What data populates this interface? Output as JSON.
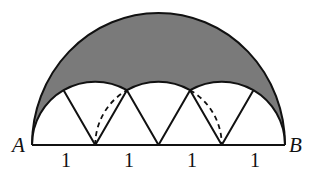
{
  "diagram": {
    "type": "geometry-figure",
    "points": {
      "A": {
        "label": "A"
      },
      "B": {
        "label": "B"
      }
    },
    "segment_labels": [
      "1",
      "1",
      "1",
      "1"
    ],
    "colors": {
      "shade": "#7a7a7a",
      "stroke": "#111111",
      "background": "#ffffff"
    },
    "elements": [
      {
        "name": "large-semicircle",
        "style": "solid"
      },
      {
        "name": "small-arcs",
        "count": 3,
        "radius": "1",
        "style": "solid"
      },
      {
        "name": "zigzag-segments",
        "count": 6,
        "style": "solid"
      },
      {
        "name": "dashed-arcs",
        "count": 2,
        "style": "dashed"
      },
      {
        "name": "shaded-region",
        "fill": "gray"
      }
    ]
  }
}
